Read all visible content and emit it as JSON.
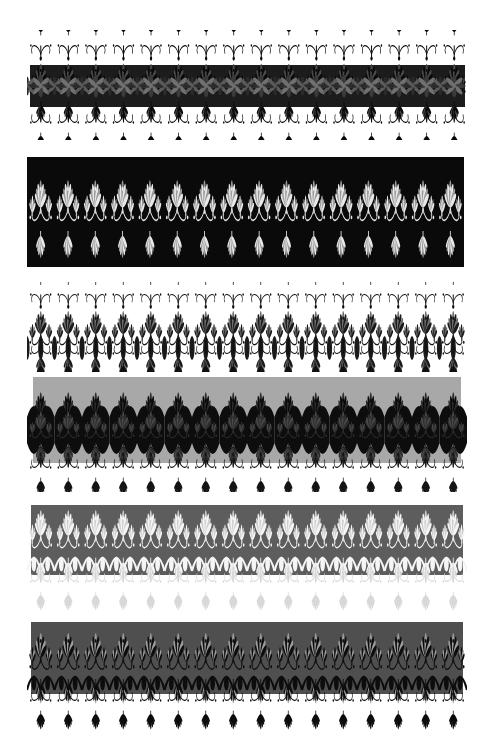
{
  "page": {
    "width": 495,
    "height": 753,
    "background": "#ffffff"
  },
  "palette": {
    "white": "#ffffff",
    "black": "#000000",
    "near_black": "#0d0d0d",
    "dark_ink": "#1c1c1c",
    "charcoal": "#2b2b2b",
    "mid_gray": "#545454",
    "slate_gray": "#5d5d5d",
    "light_gray": "#a8a8a8",
    "pale_gray": "#c9c9c9",
    "soft_white": "#f2f2f2"
  },
  "bands": [
    {
      "id": "band-1",
      "name": "dark-plate-with-black-fringe",
      "index": 1,
      "label": "Band 1",
      "x": 27,
      "y": 30,
      "width": 441,
      "height": 110,
      "plate": {
        "x": 3,
        "y": 35,
        "width": 435,
        "height": 42,
        "fill": "#1c1c1c"
      },
      "motif_fill": "#0a0a0a",
      "motif_accent": "#4a4a4a",
      "background": "#ffffff",
      "repeats": 16,
      "tile_width": 27.2,
      "top_fringe": true,
      "bottom_fringe": true,
      "fringe_fill": "#0a0a0a"
    },
    {
      "id": "band-2",
      "name": "white-on-black-plate",
      "index": 2,
      "label": "Band 2",
      "x": 27,
      "y": 157,
      "width": 437,
      "height": 110,
      "plate": {
        "x": 0,
        "y": 0,
        "width": 437,
        "height": 110,
        "fill": "#0a0a0a"
      },
      "motif_fill": "#e8e8e8",
      "motif_accent": "#9a9a9a",
      "background": "#0a0a0a",
      "repeats": 16,
      "tile_width": 27.3,
      "top_fringe": false,
      "bottom_fringe": false,
      "fringe_fill": "#e8e8e8"
    },
    {
      "id": "band-3",
      "name": "open-lace-on-white",
      "index": 3,
      "label": "Band 3",
      "x": 27,
      "y": 282,
      "width": 440,
      "height": 90,
      "plate": null,
      "motif_fill": "#1a1a1a",
      "motif_accent": "#6e6e6e",
      "background": "#ffffff",
      "repeats": 16,
      "tile_width": 27.5,
      "top_fringe": true,
      "bottom_fringe": true,
      "fringe_fill": "#111111"
    },
    {
      "id": "band-4",
      "name": "gray-plate-black-scallop",
      "index": 4,
      "label": "Band 4",
      "x": 27,
      "y": 377,
      "width": 440,
      "height": 115,
      "plate": {
        "x": 6,
        "y": 0,
        "width": 428,
        "height": 86,
        "fill": "#a8a8a8"
      },
      "motif_fill": "#0a0a0a",
      "motif_accent": "#2d2d2d",
      "background": "#ffffff",
      "repeats": 16,
      "tile_width": 27.5,
      "top_fringe": false,
      "bottom_fringe": true,
      "fringe_fill": "#151515"
    },
    {
      "id": "band-5",
      "name": "white-lace-on-slate-plate",
      "index": 5,
      "label": "Band 5",
      "x": 27,
      "y": 505,
      "width": 440,
      "height": 112,
      "plate": {
        "x": 4,
        "y": 0,
        "width": 432,
        "height": 70,
        "fill": "#5d5d5d"
      },
      "motif_fill": "#f5f5f5",
      "motif_accent": "#cfcfcf",
      "background": "#ffffff",
      "repeats": 16,
      "tile_width": 27.5,
      "top_fringe": false,
      "bottom_fringe": true,
      "fringe_fill": "#d8d8d8"
    },
    {
      "id": "band-6",
      "name": "black-lace-on-slate-plate",
      "index": 6,
      "label": "Band 6",
      "x": 27,
      "y": 622,
      "width": 440,
      "height": 112,
      "plate": {
        "x": 4,
        "y": 0,
        "width": 432,
        "height": 72,
        "fill": "#4f4f4f"
      },
      "motif_fill": "#0d0d0d",
      "motif_accent": "#9d9d9d",
      "background": "#ffffff",
      "repeats": 16,
      "tile_width": 27.5,
      "top_fringe": false,
      "bottom_fringe": true,
      "fringe_fill": "#0d0d0d"
    }
  ]
}
